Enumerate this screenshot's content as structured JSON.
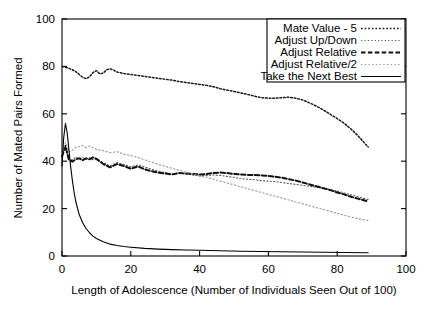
{
  "chart_data": {
    "type": "line",
    "title": "",
    "xlabel": "Length of Adolescence (Number of Individuals Seen Out of 100)",
    "ylabel": "Number of Mated Pairs Formed",
    "xlim": [
      0,
      100
    ],
    "ylim": [
      0,
      100
    ],
    "xticks": [
      0,
      20,
      40,
      60,
      80,
      100
    ],
    "yticks": [
      0,
      20,
      40,
      60,
      80,
      100
    ],
    "grid": false,
    "legend_position": "top-right",
    "series": [
      {
        "name": "Mate Value - 5",
        "style": "dotted",
        "color": "#1a1a1a",
        "x": [
          0,
          1,
          2,
          3,
          4,
          5,
          6,
          7,
          8,
          9,
          10,
          11,
          12,
          13,
          14,
          15,
          16,
          18,
          20,
          22,
          24,
          26,
          28,
          30,
          32,
          34,
          36,
          38,
          40,
          42,
          44,
          46,
          48,
          50,
          52,
          54,
          56,
          58,
          60,
          62,
          64,
          66,
          68,
          70,
          72,
          74,
          76,
          78,
          80,
          82,
          84,
          86,
          88,
          89
        ],
        "y": [
          80,
          79.6,
          79.2,
          78.6,
          77.8,
          76.6,
          75.4,
          74.8,
          75.6,
          77.4,
          78.2,
          76.8,
          77.2,
          78.6,
          79.0,
          78.4,
          77.6,
          77.0,
          76.6,
          76.2,
          75.8,
          75.4,
          75.0,
          74.6,
          74.2,
          73.6,
          73.2,
          72.8,
          72.4,
          72.0,
          71.4,
          70.6,
          70.0,
          69.4,
          68.8,
          68.2,
          67.4,
          66.8,
          66.6,
          66.6,
          66.8,
          67.0,
          66.6,
          65.8,
          64.6,
          63.2,
          61.6,
          59.8,
          58.0,
          56.0,
          53.6,
          50.8,
          47.6,
          46.0
        ]
      },
      {
        "name": "Adjust Up/Down",
        "style": "fine-dotted",
        "color": "#555555",
        "x": [
          0,
          1,
          2,
          3,
          4,
          5,
          6,
          7,
          8,
          9,
          10,
          12,
          14,
          16,
          18,
          20,
          22,
          24,
          26,
          28,
          30,
          32,
          34,
          36,
          38,
          40,
          42,
          44,
          46,
          48,
          50,
          52,
          54,
          56,
          58,
          60,
          62,
          64,
          66,
          68,
          70,
          72,
          74,
          76,
          78,
          80,
          82,
          84,
          86,
          88,
          89
        ],
        "y": [
          44.0,
          45.0,
          41.0,
          40.5,
          41.8,
          41.0,
          41.6,
          40.8,
          41.4,
          40.6,
          41.0,
          39.4,
          38.0,
          39.4,
          38.6,
          37.6,
          38.4,
          37.6,
          36.6,
          35.8,
          35.2,
          34.6,
          35.0,
          34.6,
          34.2,
          33.8,
          34.0,
          34.2,
          34.0,
          33.6,
          33.2,
          32.6,
          32.4,
          32.2,
          31.8,
          31.6,
          31.4,
          31.0,
          30.6,
          30.2,
          29.8,
          29.4,
          29.0,
          28.6,
          28.0,
          27.4,
          26.6,
          25.8,
          25.0,
          24.2,
          23.8
        ]
      },
      {
        "name": "Adjust Relative",
        "style": "dashed",
        "color": "#111111",
        "x": [
          0,
          1,
          2,
          3,
          4,
          5,
          6,
          7,
          8,
          9,
          10,
          12,
          14,
          16,
          18,
          20,
          22,
          24,
          26,
          28,
          30,
          32,
          34,
          36,
          38,
          40,
          42,
          44,
          46,
          48,
          50,
          52,
          54,
          56,
          58,
          60,
          62,
          64,
          66,
          68,
          70,
          72,
          74,
          76,
          78,
          80,
          82,
          84,
          86,
          88,
          89
        ],
        "y": [
          42.0,
          46.5,
          40.6,
          39.8,
          40.8,
          41.2,
          40.4,
          41.2,
          40.8,
          41.6,
          41.0,
          38.8,
          37.4,
          38.8,
          38.0,
          36.8,
          37.8,
          36.6,
          35.8,
          35.2,
          34.8,
          34.4,
          35.0,
          34.8,
          34.6,
          34.4,
          34.6,
          35.0,
          35.2,
          35.0,
          34.6,
          34.4,
          34.2,
          34.2,
          34.0,
          33.8,
          33.4,
          33.0,
          32.4,
          31.8,
          31.0,
          30.2,
          29.4,
          28.6,
          27.8,
          26.8,
          26.0,
          25.0,
          24.2,
          23.4,
          23.0
        ]
      },
      {
        "name": "Adjust Relative/2",
        "style": "light-dotted",
        "color": "#9a9a9a",
        "x": [
          0,
          1,
          2,
          3,
          4,
          5,
          6,
          7,
          8,
          9,
          10,
          12,
          14,
          16,
          18,
          20,
          22,
          24,
          26,
          28,
          30,
          32,
          34,
          36,
          38,
          40,
          42,
          44,
          46,
          48,
          50,
          52,
          54,
          56,
          58,
          60,
          62,
          64,
          66,
          68,
          70,
          72,
          74,
          76,
          78,
          80,
          82,
          84,
          86,
          88,
          89
        ],
        "y": [
          43.0,
          48.0,
          44.0,
          44.6,
          45.8,
          46.2,
          46.6,
          45.8,
          46.4,
          45.6,
          45.0,
          44.4,
          43.6,
          44.0,
          43.0,
          42.4,
          41.6,
          40.6,
          39.6,
          38.6,
          37.8,
          37.0,
          36.2,
          35.4,
          34.6,
          33.8,
          33.2,
          32.4,
          31.6,
          30.8,
          30.0,
          29.2,
          28.4,
          27.6,
          26.8,
          26.0,
          25.2,
          24.4,
          23.6,
          22.8,
          22.0,
          21.2,
          20.4,
          19.6,
          18.8,
          18.0,
          17.2,
          16.4,
          15.8,
          15.2,
          15.0
        ]
      },
      {
        "name": "Take the Next Best",
        "style": "solid",
        "color": "#000000",
        "x": [
          0,
          0.5,
          1,
          1.5,
          2,
          2.5,
          3,
          3.5,
          4,
          5,
          6,
          7,
          8,
          9,
          10,
          12,
          14,
          16,
          18,
          20,
          24,
          28,
          32,
          36,
          40,
          46,
          52,
          58,
          64,
          70,
          76,
          82,
          88,
          89
        ],
        "y": [
          38.0,
          50.0,
          56.0,
          52.0,
          45.0,
          38.0,
          32.0,
          27.0,
          23.0,
          17.5,
          14.0,
          11.6,
          9.8,
          8.4,
          7.4,
          6.0,
          5.0,
          4.4,
          4.0,
          3.7,
          3.2,
          2.9,
          2.7,
          2.5,
          2.4,
          2.2,
          2.0,
          1.9,
          1.8,
          1.7,
          1.6,
          1.5,
          1.4,
          1.4
        ]
      }
    ]
  }
}
